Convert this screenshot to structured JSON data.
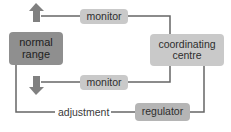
{
  "diagram": {
    "type": "feedback-loop",
    "nodes": {
      "normal_range": {
        "label_line1": "normal",
        "label_line2": "range"
      },
      "coordinating_centre": {
        "label_line1": "coordinating",
        "label_line2": "centre"
      },
      "monitor_top": {
        "label": "monitor"
      },
      "monitor_bottom": {
        "label": "monitor"
      },
      "regulator": {
        "label": "regulator"
      },
      "adjustment": {
        "label": "adjustment"
      }
    },
    "indicators": {
      "increase": {
        "icon": "arrow-up-icon",
        "meaning": "above normal"
      },
      "decrease": {
        "icon": "arrow-down-icon",
        "meaning": "below normal"
      }
    },
    "edges": [
      {
        "from": "increase",
        "to": "monitor_top"
      },
      {
        "from": "monitor_top",
        "to": "coordinating_centre"
      },
      {
        "from": "decrease",
        "to": "monitor_bottom"
      },
      {
        "from": "monitor_bottom",
        "to": "coordinating_centre"
      },
      {
        "from": "coordinating_centre",
        "to": "regulator"
      },
      {
        "from": "regulator",
        "to": "adjustment"
      },
      {
        "from": "adjustment",
        "to": "normal_range"
      }
    ],
    "colors": {
      "dark_box": "#8f8f8f",
      "light_box": "#c9c9c9",
      "mid_box": "#b5b5b5",
      "line": "#666666",
      "arrow": "#808080"
    }
  }
}
